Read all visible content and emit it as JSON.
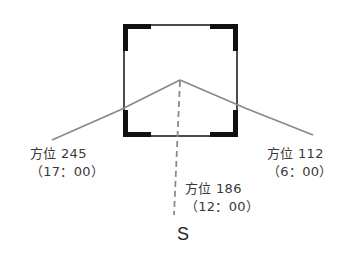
{
  "diagram": {
    "type": "azimuth diagram",
    "building": {
      "shape": "square",
      "corners": "thick black corner brackets"
    },
    "direction_label": "S",
    "azimuths": [
      {
        "label": "方位 245",
        "time": "（17：00）",
        "side": "left"
      },
      {
        "label": "方位 186",
        "time": "（12：00）",
        "side": "center",
        "line_style": "dashed"
      },
      {
        "label": "方位 112",
        "time": "（6：00）",
        "side": "right"
      }
    ],
    "colors": {
      "building_outline": "#111111",
      "azimuth_lines": "#8a8a8a",
      "text": "#3a3a3a"
    }
  }
}
